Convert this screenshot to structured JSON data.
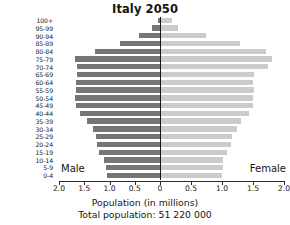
{
  "chart_data": {
    "type": "bar",
    "subtype": "population-pyramid",
    "title": "Italy 2050",
    "xlabel": "Population (in millions)",
    "ylabel": "",
    "annotation": "Total population: 51 220 000",
    "grid": false,
    "legend_position": "inline-axis-ends",
    "xlim": [
      -2.0,
      2.0
    ],
    "xtick_labels": [
      "2.0",
      "1.5",
      "1.0",
      "0.5",
      "0",
      "0.5",
      "1.0",
      "1.5",
      "2.0"
    ],
    "xtick_values": [
      -2.0,
      -1.5,
      -1.0,
      -0.5,
      0,
      0.5,
      1.0,
      1.5,
      2.0
    ],
    "categories": [
      "0-4",
      "5-9",
      "10-14",
      "15-19",
      "20-24",
      "25-29",
      "30-34",
      "35-39",
      "40-44",
      "45-49",
      "50-54",
      "55-59",
      "60-64",
      "65-69",
      "70-74",
      "75-79",
      "80-84",
      "85-89",
      "90-94",
      "95-99",
      "100+"
    ],
    "series": [
      {
        "name": "Male",
        "color": "#767676",
        "values": [
          1.05,
          1.07,
          1.1,
          1.2,
          1.25,
          1.27,
          1.32,
          1.45,
          1.58,
          1.66,
          1.68,
          1.67,
          1.66,
          1.65,
          1.64,
          1.68,
          1.28,
          0.8,
          0.42,
          0.16,
          0.03
        ]
      },
      {
        "name": "Female",
        "color": "#cbcbcb",
        "values": [
          0.99,
          1.0,
          1.0,
          1.06,
          1.13,
          1.15,
          1.22,
          1.29,
          1.42,
          1.49,
          1.48,
          1.5,
          1.49,
          1.5,
          1.73,
          1.79,
          1.7,
          1.27,
          0.72,
          0.28,
          0.18
        ]
      }
    ]
  },
  "labels": {
    "male": "Male",
    "female": "Female"
  }
}
